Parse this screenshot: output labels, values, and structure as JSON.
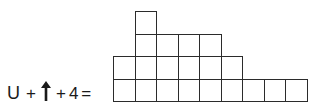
{
  "equation": {
    "term1": "U",
    "op1": "+",
    "term2_icon": "up-arrow-icon",
    "op2": "+",
    "term3": "4",
    "equals": "="
  },
  "grid": {
    "origin_x": 113,
    "origin_y": 11,
    "cell_width": 21.5,
    "cell_height": 22.5,
    "line_color": "#2b2b2b",
    "rows": [
      {
        "row": 1,
        "start_col": 2,
        "count": 1
      },
      {
        "row": 2,
        "start_col": 2,
        "count": 4
      },
      {
        "row": 3,
        "start_col": 1,
        "count": 6
      },
      {
        "row": 4,
        "start_col": 1,
        "count": 9
      }
    ],
    "total_cells": 20
  }
}
